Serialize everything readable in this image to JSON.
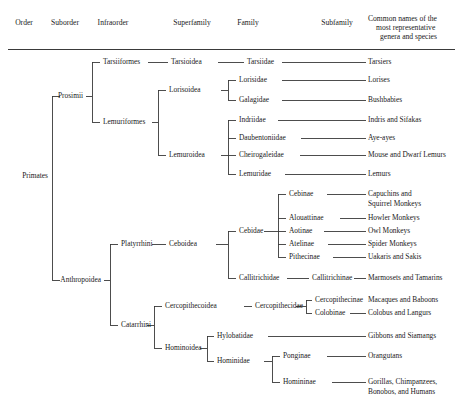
{
  "figure": {
    "type": "taxonomy-cladogram",
    "columns": [
      {
        "id": "order",
        "label": "Order",
        "x": 24
      },
      {
        "id": "suborder",
        "label": "Suborder",
        "x": 65
      },
      {
        "id": "infraorder",
        "label": "Infraorder",
        "x": 108
      },
      {
        "id": "superfamily",
        "label": "Superfamily",
        "x": 192
      },
      {
        "id": "family",
        "label": "Family",
        "x": 262
      },
      {
        "id": "subfamily",
        "label": "Subfamily",
        "x": 337
      },
      {
        "id": "common",
        "label": "Common names of the\nmost representative\ngenera and species",
        "x": 368
      }
    ],
    "header": {
      "order": "Order",
      "suborder": "Suborder",
      "infraorder": "Infraorder",
      "superfamily": "Superfamily",
      "family": "Family",
      "subfamily": "Subfamily",
      "common_line1": "Common names of the",
      "common_line2": "most representative",
      "common_line3": "genera and species"
    },
    "rule_color": "#3a3a3a",
    "line_color": "#3a3a3a"
  },
  "nodes": {
    "order": {
      "primates": "Primates"
    },
    "suborder": {
      "prosimii": "Prosimii",
      "anthropoidea": "Anthropoidea"
    },
    "infraorder": {
      "tarsiiformes": "Tarsiiformes",
      "lemuriformes": "Lemuriformes",
      "platyrrhini": "Platyrrhini",
      "catarrhini": "Catarrhini"
    },
    "superfamily": {
      "tarsioidea": "Tarsioidea",
      "lorisoidea": "Lorisoidea",
      "lemuroidea": "Lemuroidea",
      "ceboidea": "Ceboidea",
      "cercopithecoidea": "Cercopithecoidea",
      "hominoidea": "Hominoidea"
    },
    "family": {
      "tarsiidae": "Tarsiidae",
      "lorisidae": "Lorisidae",
      "galagidae": "Galagidae",
      "indriidae": "Indriidae",
      "daubentoniidae": "Daubentoniidae",
      "cheirogaleidae": "Cheirogaleidae",
      "lemuridae": "Lemuridae",
      "cebidae": "Cebidae",
      "callitrichidae": "Callitrichidae",
      "cercopithecidae": "Cercopithecidae",
      "hylobatidae": "Hylobatidae",
      "hominidae": "Hominidae"
    },
    "subfamily": {
      "cebinae": "Cebinae",
      "alouattinae": "Alouattinae",
      "aotinae": "Aotinae",
      "atelinae": "Atelinae",
      "pithecinae": "Pithecinae",
      "callitrichinae": "Callitrichinae",
      "cercopithecinae": "Cercopithecinae",
      "colobinae": "Colobinae",
      "ponginae": "Ponginae",
      "homininae": "Homininae"
    },
    "common": {
      "tarsiers": "Tarsiers",
      "lorises": "Lorises",
      "bushbabies": "Bushbabies",
      "indris_sifakas": "Indris and Sifakas",
      "aye_ayes": "Aye-ayes",
      "mouse_dwarf_lemurs": "Mouse and Dwarf Lemurs",
      "lemurs": "Lemurs",
      "capuchins_l1": "Capuchins and",
      "capuchins_l2": "Squirrel Monkeys",
      "howler": "Howler Monkeys",
      "owl": "Owl Monkeys",
      "spider": "Spider Monkeys",
      "uakaris_sakis": "Uakaris and Sakis",
      "marmosets_tamarins": "Marmosets and Tamarins",
      "macaques_baboons": "Macaques and Baboons",
      "colobus_langurs": "Colobus and Langurs",
      "gibbons_siamangs": "Gibbons and Siamangs",
      "orangutans": "Orangutans",
      "great_apes_l1": "Gorillas, Chimpanzees,",
      "great_apes_l2": "Bonobos, and Humans"
    }
  }
}
